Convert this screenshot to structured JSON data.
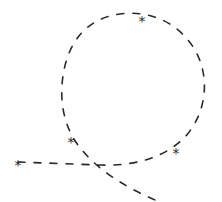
{
  "diagram": {
    "type": "hand-drawn dashed path with loop",
    "stroke_color": "#2a2a2a",
    "background": "#ffffff",
    "path": "M 18 162 L 100 165 C 130 166 160 160 182 140 C 205 118 212 80 195 50 C 178 22 150 10 120 14 C 88 18 70 40 64 70 C 58 100 64 130 82 150 C 100 172 130 190 160 202",
    "dash": "7 9",
    "markers": [
      {
        "name": "start-star",
        "symbol": "*",
        "x": 18,
        "y": 162
      },
      {
        "name": "loop-left-star",
        "symbol": "*",
        "x": 71,
        "y": 139
      },
      {
        "name": "loop-top-star",
        "symbol": "*",
        "x": 142,
        "y": 18
      },
      {
        "name": "loop-right-star",
        "symbol": "*",
        "x": 176,
        "y": 150
      }
    ]
  }
}
